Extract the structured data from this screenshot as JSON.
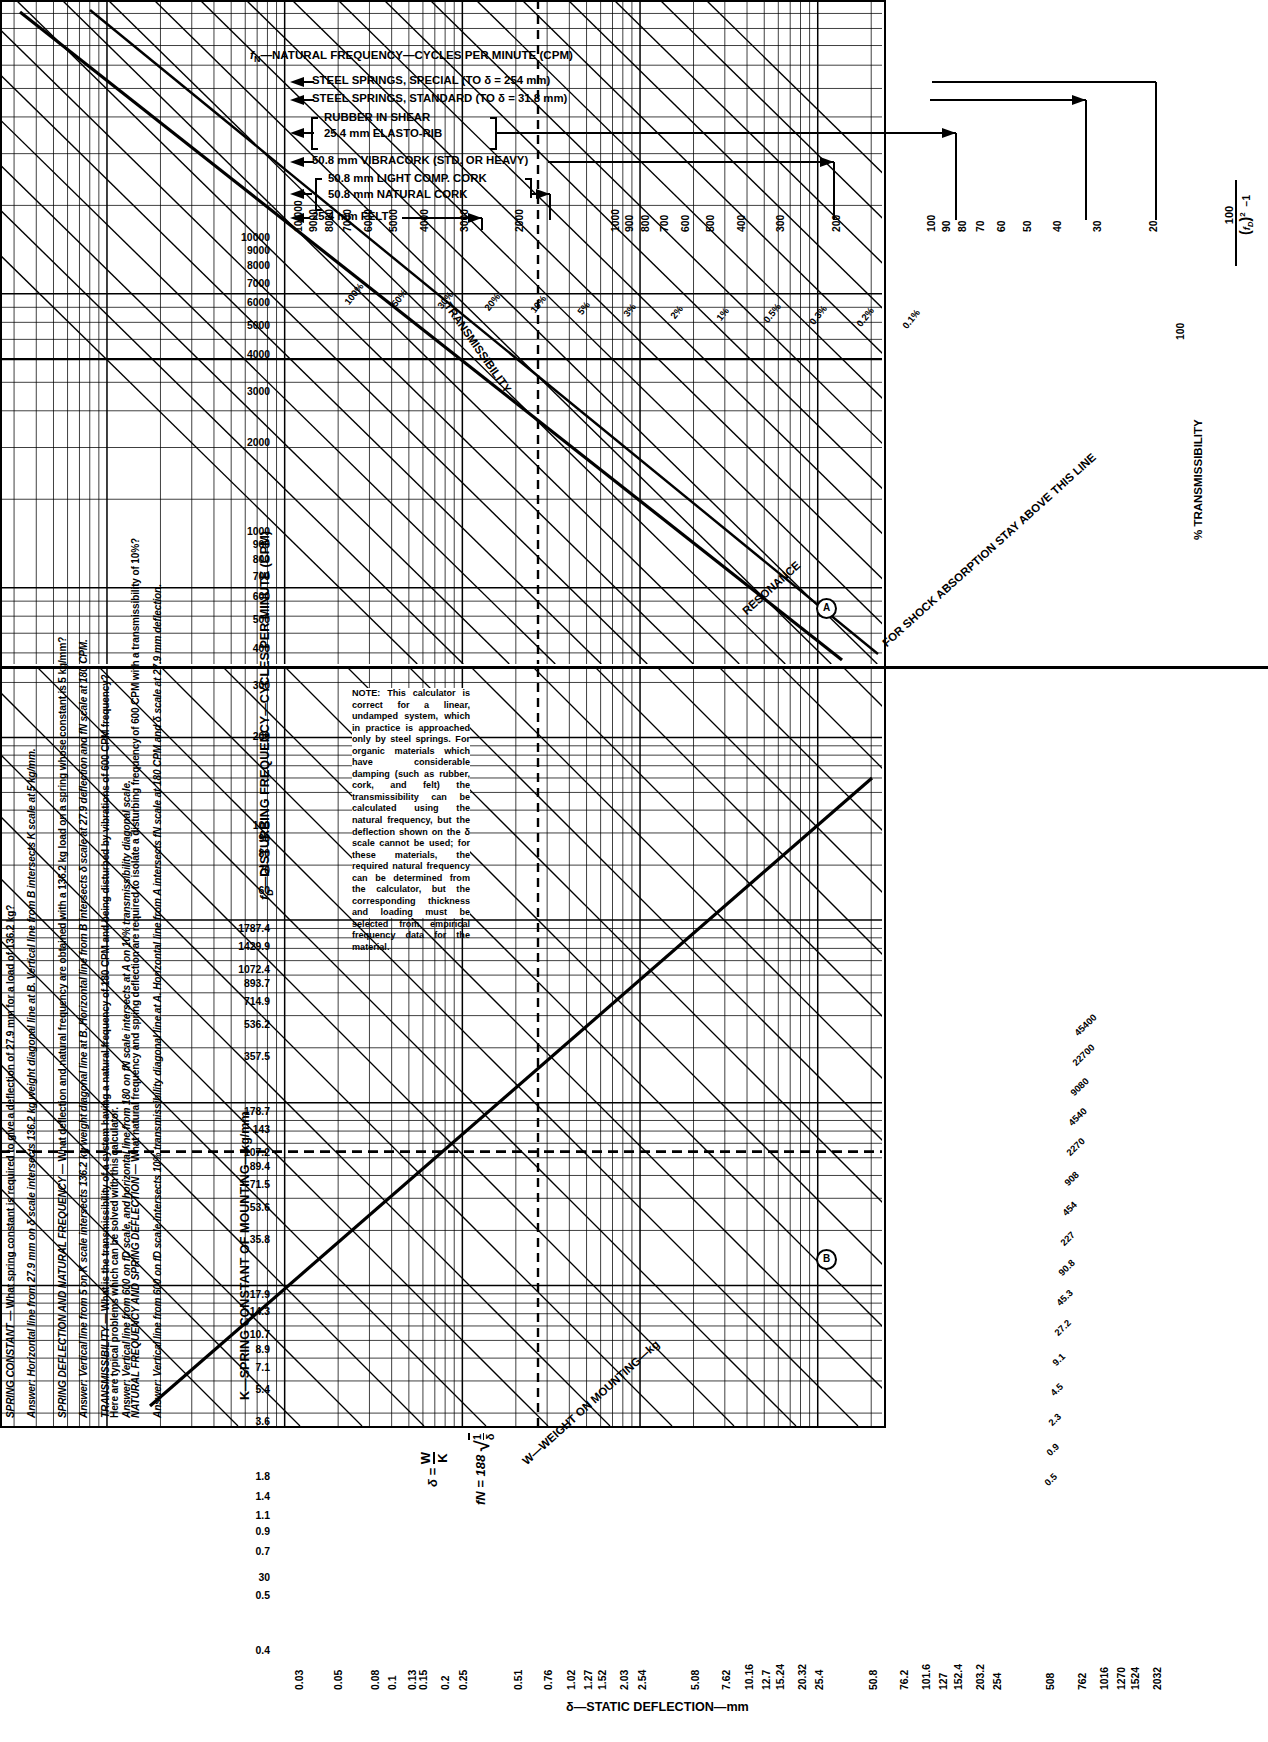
{
  "left_column": {
    "intro": "Here are typical problems which can be solved with this calculator.",
    "blocks": [
      {
        "heading": "NATURAL FREQUENCY AND SPRING DEFLECTION",
        "question": "— What natural frequency and spring deflection are required to isolate a disturbing frequency of 600 CPM with a transmissibility of 10%?",
        "answer": "Answer: Vertical line from 600 on fD scale intersects 10% transmissibility diagonal line at A. Horizontal line from A intersects fN scale at 180 CPM and δ scale at 27.9 mm deflection."
      },
      {
        "heading": "SPRING DEFLECTION AND NATURAL FREQUENCY",
        "question": "— What deflection and natural frequency are obtained with a 136.2 kg load on a spring whose constant is 5 kg/mm?",
        "answer": "Answer: Vertical line from 5 on K scale intersects 136.2 kg weight diagonal line at B. Horizontal line from B intersects δ scale at 27.9 deflection and fN scale at 180 CPM."
      },
      {
        "heading": "TRANSMISSIBILITY",
        "question": "— What is the transmissibility of a system having a natural frequency of 180 CPM and being disturbed by vibrations of 600 CPM frequency?",
        "answer": "Answer: Vertical line from 600 on fD scale, and horizontal line from 180 on fN scale intersects at A on 10% transmissibility diagonal scale."
      },
      {
        "heading": "SPRING CONSTANT",
        "question": "— What spring constant is required to give a deflection of 27.9 mm for a load of 136.2 kg?",
        "answer": "Answer: Horizontal line from 27.9 mm on δ scale intersects 136.2 kg weight diagonal line at B. Vertical line from B intersects K scale at 5 kg/mm."
      }
    ]
  },
  "header": {
    "axis_title": "fN—NATURAL FREQUENCY—CYCLES PER MINUTE (CPM)",
    "materials": [
      {
        "label": "STEEL SPRINGS, SPECIAL (TO δ = 254 mm)",
        "from": 10000,
        "to": 30
      },
      {
        "label": "STEEL SPRINGS, STANDARD (TO δ = 31.8 mm)",
        "from": 10000,
        "to": 60
      },
      {
        "label_line1": "RUBBER IN SHEAR",
        "label_line2": "25.4 mm ELASTO-RIB",
        "from": 10000,
        "to": 200,
        "bracket": true
      },
      {
        "label": "50.8 mm VIBRACORK (STD. OR HEAVY)",
        "from": 10000,
        "to": 400
      },
      {
        "label_line1": "50.8 mm LIGHT COMP. CORK",
        "label_line2": "50.8 mm NATURAL CORK",
        "from": 10000,
        "to": 900,
        "bracket": true
      },
      {
        "label": "25.4 mm FELT",
        "from": 10000,
        "to": 2000
      }
    ]
  },
  "note": {
    "prefix": "NOTE:",
    "body": "This calculator is correct for a linear, undamped system, which in practice is approached only by steel springs. For organic materials which have considerable damping (such as rubber, cork, and felt) the transmissibility can be calculated using the natural frequency, but the deflection shown on the δ scale cannot be used; for these materials, the required natural frequency can be determined from the calculator, but the corresponding thickness and loading must be selected from empirical frequency data for the material."
  },
  "labels": {
    "y_axis_left": "fD—DISTURBING FREQUENCY—CYCLES PER MINUTE (CPM)",
    "y_axis_lower": "K—SPRING CONSTANT OF MOUNTING—kg/mm",
    "x_axis_bottom": "δ—STATIC DEFLECTION—mm",
    "transmissibility_diag": "TRANSMISSIBILITY",
    "resonance": "RESONANCE",
    "shock_absorption": "FOR SHOCK ABSORPTION STAY ABOVE THIS LINE",
    "weight_diag": "W—WEIGHT ON MOUNTING—kg",
    "pct_transmissibility": "% TRANSMISSIBILITY",
    "formula_trans_num": "100",
    "formula_trans_lhs": "TRANSMISSIBILITY =",
    "formula_delta": "δ =",
    "formula_delta_num": "W",
    "formula_delta_den": "K",
    "formula_fn": "fN = 188",
    "formula_fn_num": "1",
    "formula_fn_den": "δ",
    "callout_a": "A",
    "callout_b": "B"
  },
  "chart_data": {
    "type": "line",
    "xlabel": "δ—STATIC DEFLECTION—mm",
    "ylabel": "fD—DISTURBING FREQUENCY—CYCLES PER MINUTE (CPM)",
    "grid": true,
    "fn_top_axis": {
      "name": "fN—NATURAL FREQUENCY—CYCLES PER MINUTE (CPM)",
      "ticks": [
        "10,000",
        "9000",
        "8000",
        "7000",
        "6000",
        "5000",
        "4000",
        "3000",
        "2000",
        "1000",
        "900",
        "800",
        "700",
        "600",
        "500",
        "400",
        "300",
        "200",
        "100",
        "90",
        "80",
        "70",
        "60",
        "50",
        "40",
        "30",
        "20"
      ],
      "values": [
        10000,
        9000,
        8000,
        7000,
        6000,
        5000,
        4000,
        3000,
        2000,
        1000,
        900,
        800,
        700,
        600,
        500,
        400,
        300,
        200,
        100,
        90,
        80,
        70,
        60,
        50,
        40,
        30,
        20
      ]
    },
    "fd_left_axis": {
      "name": "fD—DISTURBING FREQUENCY—CYCLES PER MINUTE (CPM)",
      "ticks": [
        "10000",
        "9000",
        "8000",
        "7000",
        "6000",
        "5000",
        "4000",
        "3000",
        "2000",
        "1000",
        "900",
        "800",
        "700",
        "600",
        "500",
        "400",
        "300",
        "200",
        "100",
        "90",
        "80",
        "70",
        "60"
      ],
      "values": [
        10000,
        9000,
        8000,
        7000,
        6000,
        5000,
        4000,
        3000,
        2000,
        1000,
        900,
        800,
        700,
        600,
        500,
        400,
        300,
        200,
        100,
        90,
        80,
        70,
        60
      ]
    },
    "k_left_axis": {
      "name": "K—SPRING CONSTANT OF MOUNTING—kg/mm",
      "ticks": [
        "1787.4",
        "1429.9",
        "1072.4",
        "893.7",
        "714.9",
        "536.2",
        "357.5",
        "178.7",
        "143",
        "107.2",
        "89.4",
        "71.5",
        "53.6",
        "35.8",
        "17.9",
        "14.3",
        "10.7",
        "8.9",
        "7.1",
        "5.4",
        "3.6",
        "1.8",
        "1.4",
        "1.1",
        "0.9",
        "0.7",
        "30",
        "0.5",
        "0.4",
        "0.2"
      ],
      "values": [
        1787.4,
        1429.9,
        1072.4,
        893.7,
        714.9,
        536.2,
        357.5,
        178.7,
        143,
        107.2,
        89.4,
        71.5,
        53.6,
        35.8,
        17.9,
        14.3,
        10.7,
        8.9,
        7.1,
        5.4,
        3.6,
        1.8,
        1.4,
        1.1,
        0.9,
        0.7,
        0.5,
        0.4,
        0.2
      ]
    },
    "delta_bottom_axis": {
      "name": "δ—STATIC DEFLECTION—mm",
      "ticks": [
        "0.03",
        "0.05",
        "0.08",
        "0.1",
        "0.13",
        "0.15",
        "0.2",
        "0.25",
        "0.51",
        "0.76",
        "1.02",
        "1.27",
        "1.52",
        "2.03",
        "2.54",
        "5.08",
        "7.62",
        "10.16",
        "12.7",
        "15.24",
        "20.32",
        "25.4",
        "50.8",
        "76.2",
        "101.6",
        "127",
        "152.4",
        "203.2",
        "254",
        "508",
        "762",
        "1016",
        "1270",
        "1524",
        "2032"
      ],
      "values": [
        0.03,
        0.05,
        0.08,
        0.1,
        0.13,
        0.15,
        0.2,
        0.25,
        0.51,
        0.76,
        1.02,
        1.27,
        1.52,
        2.03,
        2.54,
        5.08,
        7.62,
        10.16,
        12.7,
        15.24,
        20.32,
        25.4,
        50.8,
        76.2,
        101.6,
        127,
        152.4,
        203.2,
        254,
        508,
        762,
        1016,
        1270,
        1524,
        2032
      ]
    },
    "transmissibility_diagonals": [
      "100%",
      "50%",
      "30%",
      "20%",
      "10%",
      "5%",
      "3%",
      "2%",
      "1%",
      "0.5%",
      "0.3%",
      "0.2%",
      "0.1%"
    ],
    "pct_transmissibility_right_axis": {
      "name": "% TRANSMISSIBILITY",
      "formula": "100 / ((fD/fN)² - 1)",
      "ticks": [
        "100"
      ]
    },
    "weight_diagonals_kg": [
      "0.5",
      "0.9",
      "2.3",
      "4.5",
      "9.1",
      "27.2",
      "45.3",
      "90.8",
      "227",
      "454",
      "908",
      "1816",
      "2270",
      "4540",
      "9080",
      "18160",
      "22700",
      "45400"
    ],
    "weight_diagonals_lower_right": [
      "45400",
      "22700",
      "9080",
      "4540",
      "2270",
      "908",
      "454",
      "227",
      "90.8",
      "45.3",
      "27.2",
      "9.1",
      "4.5",
      "2.3",
      "0.9",
      "0.5"
    ],
    "markers": [
      {
        "label": "A",
        "fd": 600,
        "fn": 180,
        "transmissibility": "10%"
      },
      {
        "label": "B",
        "delta": 27.9,
        "k": 5,
        "weight": 136.2
      }
    ]
  }
}
